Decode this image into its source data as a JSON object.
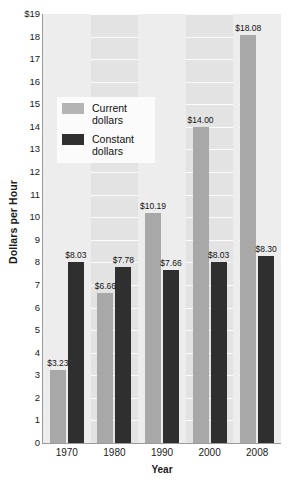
{
  "chart_data": {
    "type": "bar",
    "title": "",
    "xlabel": "Year",
    "ylabel": "Dollars per Hour",
    "categories": [
      "1970",
      "1980",
      "1990",
      "2000",
      "2008"
    ],
    "ylim": [
      0,
      19
    ],
    "ytick_step": 1,
    "ytick_labels": [
      "$19",
      "18",
      "17",
      "16",
      "15",
      "14",
      "13",
      "12",
      "11",
      "10",
      "9",
      "8",
      "7",
      "6",
      "5",
      "4",
      "3",
      "2",
      "1",
      "0"
    ],
    "grid": true,
    "legend_position": "upper-left-inside",
    "series": [
      {
        "name": "Current dollars",
        "color": "#a8a8a8",
        "values": [
          3.23,
          6.66,
          10.19,
          14.0,
          18.08
        ],
        "labels": [
          "$3.23",
          "$6.66",
          "$10.19",
          "$14.00",
          "$18.08"
        ]
      },
      {
        "name": "Constant dollars",
        "color": "#2f2f2f",
        "values": [
          8.03,
          7.78,
          7.66,
          8.03,
          8.3
        ],
        "labels": [
          "$8.03",
          "$7.78",
          "$7.66",
          "$8.03",
          "$8.30"
        ]
      }
    ]
  },
  "legend": {
    "items": [
      {
        "label": "Current dollars",
        "swatch": "current"
      },
      {
        "label": "Constant dollars",
        "swatch": "constant"
      }
    ]
  }
}
